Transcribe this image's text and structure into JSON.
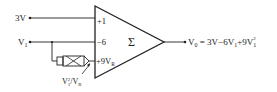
{
  "diagram": {
    "inputs": [
      {
        "label": "3V",
        "gain_label": "+1"
      },
      {
        "label": "V",
        "sub": "1",
        "gain_label": "−6"
      }
    ],
    "third_gain": {
      "text": "+9V",
      "sub": "R"
    },
    "summer_symbol": "Σ",
    "multiplier": {
      "label_main": "V",
      "label_sub": "1",
      "label_sup": "2",
      "label_div": "/V",
      "label_div_sub": "R"
    },
    "output": {
      "lhs": "V",
      "lhs_sub": "0",
      "eq": " = 3V−6V",
      "mid_sub": "1",
      "plus": "+9V",
      "end_sub": "1",
      "end_sup": "2"
    },
    "colors": {
      "line": "#222222",
      "background": "#ffffff"
    }
  }
}
